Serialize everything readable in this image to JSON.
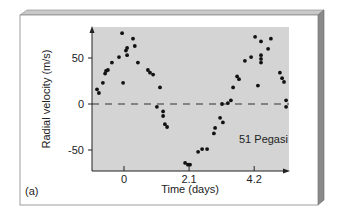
{
  "panel_label": "(a)",
  "colors": {
    "plot_bg": "#d4d4d4",
    "frame_face": "#ffffff",
    "frame_top": "#c8c8c8",
    "frame_side": "#8a8a8a",
    "point": "#111111",
    "axis": "#222222"
  },
  "chart_data": {
    "type": "scatter",
    "title": "",
    "xlabel": "Time (days)",
    "ylabel": "Radial velocity (m/s)",
    "annotation": "51 Pegasi",
    "xticks": [
      0,
      2.1,
      4.2
    ],
    "xtick_labels": [
      "0",
      "2.1",
      "4.2"
    ],
    "yticks": [
      -50,
      0,
      50
    ],
    "ytick_labels": [
      "-50",
      "0",
      "50"
    ],
    "xlim": [
      -1.05,
      5.35
    ],
    "ylim": [
      -73,
      85
    ],
    "grid": false,
    "reference_line": {
      "y": 0,
      "style": "dashed"
    },
    "series": [
      {
        "name": "51 Pegasi",
        "points": [
          [
            -0.87,
            16
          ],
          [
            -0.81,
            12
          ],
          [
            -0.68,
            23
          ],
          [
            -0.61,
            33
          ],
          [
            -0.58,
            36
          ],
          [
            -0.52,
            37
          ],
          [
            -0.39,
            45
          ],
          [
            -0.16,
            51
          ],
          [
            -0.03,
            23
          ],
          [
            -0.06,
            77
          ],
          [
            0.06,
            58
          ],
          [
            0.1,
            61
          ],
          [
            0.1,
            53
          ],
          [
            0.29,
            71
          ],
          [
            0.35,
            63
          ],
          [
            0.45,
            45
          ],
          [
            0.77,
            37
          ],
          [
            0.84,
            34
          ],
          [
            0.94,
            32
          ],
          [
            1.16,
            18
          ],
          [
            1.06,
            -3
          ],
          [
            1.26,
            -8
          ],
          [
            1.26,
            -13
          ],
          [
            1.32,
            -22
          ],
          [
            1.39,
            -25
          ],
          [
            1.97,
            -64
          ],
          [
            2.06,
            -66
          ],
          [
            2.13,
            -66
          ],
          [
            2.39,
            -52
          ],
          [
            2.52,
            -49
          ],
          [
            2.68,
            -49
          ],
          [
            2.9,
            -32
          ],
          [
            2.94,
            -26
          ],
          [
            3.1,
            -15
          ],
          [
            3.19,
            -20
          ],
          [
            3.16,
            0
          ],
          [
            3.35,
            1
          ],
          [
            3.45,
            4
          ],
          [
            3.52,
            18
          ],
          [
            3.65,
            30
          ],
          [
            3.71,
            27
          ],
          [
            3.9,
            47
          ],
          [
            4.1,
            51
          ],
          [
            4.23,
            73
          ],
          [
            4.42,
            68
          ],
          [
            4.42,
            53
          ],
          [
            4.42,
            49
          ],
          [
            4.42,
            45
          ],
          [
            4.32,
            20
          ],
          [
            4.65,
            60
          ],
          [
            4.74,
            71
          ],
          [
            5.03,
            34
          ],
          [
            5.1,
            28
          ],
          [
            5.16,
            24
          ],
          [
            5.23,
            4
          ],
          [
            5.23,
            -3
          ]
        ]
      }
    ]
  }
}
